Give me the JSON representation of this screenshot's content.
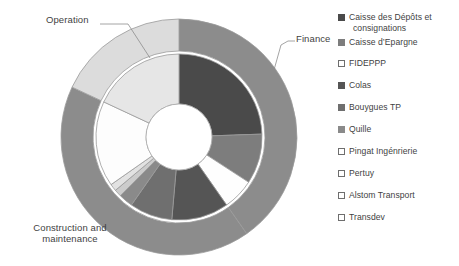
{
  "chart_data": {
    "type": "pie",
    "title": "",
    "subtype": "nested-donut",
    "rings": [
      {
        "name": "outer",
        "label": "Role categories",
        "slices": [
          {
            "label": "Finance",
            "value": 40.3,
            "start_angle": 0,
            "end_angle": 145,
            "color": "#8c8c8c"
          },
          {
            "label": "Construction and maintenance",
            "value": 41.7,
            "start_angle": 145,
            "end_angle": 295,
            "color": "#8c8c8c"
          },
          {
            "label": "Operation",
            "value": 18.0,
            "start_angle": 295,
            "end_angle": 360,
            "color": "#dcdcdc"
          }
        ]
      },
      {
        "name": "inner",
        "label": "Shareholders",
        "slices": [
          {
            "label": "Caisse des Dépôts et consignations",
            "value": 24.4,
            "start_angle": 0,
            "end_angle": 88,
            "color": "#4a4a4a"
          },
          {
            "label": "Caisse d'Epargne",
            "value": 9.7,
            "start_angle": 88,
            "end_angle": 123,
            "color": "#7d7d7d"
          },
          {
            "label": "FIDEPPP",
            "value": 6.1,
            "start_angle": 123,
            "end_angle": 145,
            "color": "#fefefe"
          },
          {
            "label": "Colas",
            "value": 11.1,
            "start_angle": 145,
            "end_angle": 185,
            "color": "#555555"
          },
          {
            "label": "Bouygues TP",
            "value": 8.3,
            "start_angle": 185,
            "end_angle": 215,
            "color": "#6f6f6f"
          },
          {
            "label": "Quille",
            "value": 2.8,
            "start_angle": 215,
            "end_angle": 225,
            "color": "#8a8a8a"
          },
          {
            "label": "Pingat Ingénrierie",
            "value": 1.4,
            "start_angle": 225,
            "end_angle": 230,
            "color": "#cccccc"
          },
          {
            "label": "Pertuy",
            "value": 1.4,
            "start_angle": 230,
            "end_angle": 235,
            "color": "#e2e2e2"
          },
          {
            "label": "Alstom Transport",
            "value": 16.7,
            "start_angle": 235,
            "end_angle": 295,
            "color": "#fdfdfd"
          },
          {
            "label": "Transdev",
            "value": 18.0,
            "start_angle": 295,
            "end_angle": 360,
            "color": "#e6e6e6"
          }
        ]
      }
    ],
    "legend": {
      "position": "right",
      "entries": [
        {
          "label": "Caisse des Dépôts et",
          "label_cont": "consignations",
          "color": "#4a4a4a",
          "outlined": false
        },
        {
          "label": "Caisse d’Epargne",
          "color": "#7d7d7d",
          "outlined": false
        },
        {
          "label": "FIDEPPP",
          "color": "#ffffff",
          "outlined": true
        },
        {
          "label": "Colas",
          "color": "#555555",
          "outlined": false
        },
        {
          "label": "Bouygues TP",
          "color": "#6f6f6f",
          "outlined": false
        },
        {
          "label": "Quille",
          "color": "#8a8a8a",
          "outlined": false
        },
        {
          "label": "Pingat Ingénrierie",
          "color": "#ffffff",
          "outlined": true
        },
        {
          "label": "Pertuy",
          "color": "#ffffff",
          "outlined": true
        },
        {
          "label": "Alstom Transport",
          "color": "#ffffff",
          "outlined": true
        },
        {
          "label": "Transdev",
          "color": "#ffffff",
          "outlined": true
        }
      ]
    },
    "annotations": [
      {
        "id": "operation",
        "text": "Operation"
      },
      {
        "id": "finance",
        "text": "Finance"
      },
      {
        "id": "construction",
        "text": "Construction and maintenance"
      }
    ]
  },
  "callouts": {
    "operation": "Operation",
    "finance": "Finance",
    "construction_line1": "Construction and",
    "construction_line2": "maintenance"
  }
}
